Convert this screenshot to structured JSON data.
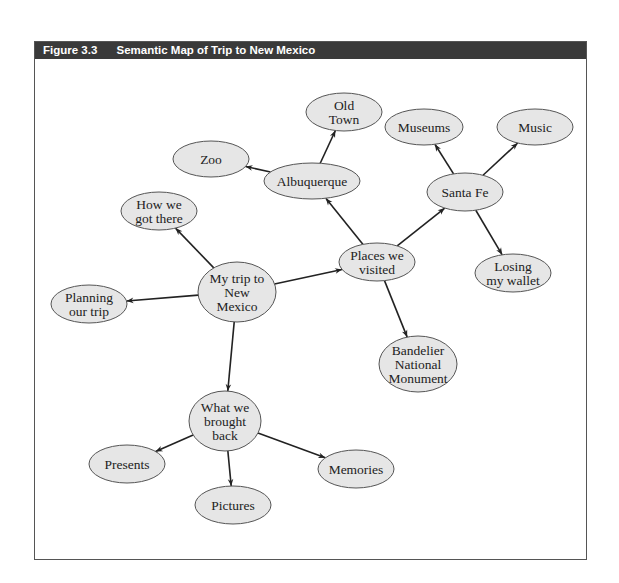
{
  "figure": {
    "number": "Figure 3.3",
    "title": "Semantic Map of Trip to New Mexico",
    "colors": {
      "header_bg": "#3a3a3a",
      "node_fill": "#e6e6e6",
      "node_stroke": "#555555",
      "edge": "#222222"
    }
  },
  "nodes": [
    {
      "id": "center",
      "lines": [
        "My trip to",
        "New",
        "Mexico"
      ],
      "cx": 237,
      "cy": 292,
      "rx": 39,
      "ry": 30
    },
    {
      "id": "howgot",
      "lines": [
        "How we",
        "got there"
      ],
      "cx": 159,
      "cy": 211,
      "rx": 38,
      "ry": 19
    },
    {
      "id": "planning",
      "lines": [
        "Planning",
        "our trip"
      ],
      "cx": 89,
      "cy": 304,
      "rx": 38,
      "ry": 19
    },
    {
      "id": "places",
      "lines": [
        "Places we",
        "visited"
      ],
      "cx": 377,
      "cy": 262,
      "rx": 38,
      "ry": 19
    },
    {
      "id": "albq",
      "lines": [
        "Albuquerque"
      ],
      "cx": 312,
      "cy": 181,
      "rx": 48,
      "ry": 18
    },
    {
      "id": "zoo",
      "lines": [
        "Zoo"
      ],
      "cx": 211,
      "cy": 159,
      "rx": 38,
      "ry": 18
    },
    {
      "id": "oldtown",
      "lines": [
        "Old",
        "Town"
      ],
      "cx": 344,
      "cy": 112,
      "rx": 38,
      "ry": 19
    },
    {
      "id": "santafe",
      "lines": [
        "Santa Fe"
      ],
      "cx": 465,
      "cy": 192,
      "rx": 38,
      "ry": 19
    },
    {
      "id": "museums",
      "lines": [
        "Museums"
      ],
      "cx": 424,
      "cy": 127,
      "rx": 39,
      "ry": 18
    },
    {
      "id": "music",
      "lines": [
        "Music"
      ],
      "cx": 535,
      "cy": 127,
      "rx": 38,
      "ry": 18
    },
    {
      "id": "wallet",
      "lines": [
        "Losing",
        "my wallet"
      ],
      "cx": 513,
      "cy": 273,
      "rx": 38,
      "ry": 19
    },
    {
      "id": "bandelier",
      "lines": [
        "Bandelier",
        "National",
        "Monument"
      ],
      "cx": 418,
      "cy": 364,
      "rx": 39,
      "ry": 28
    },
    {
      "id": "brought",
      "lines": [
        "What we",
        "brought",
        "back"
      ],
      "cx": 225,
      "cy": 421,
      "rx": 36,
      "ry": 30
    },
    {
      "id": "presents",
      "lines": [
        "Presents"
      ],
      "cx": 127,
      "cy": 464,
      "rx": 38,
      "ry": 19
    },
    {
      "id": "pictures",
      "lines": [
        "Pictures"
      ],
      "cx": 233,
      "cy": 505,
      "rx": 38,
      "ry": 19
    },
    {
      "id": "memories",
      "lines": [
        "Memories"
      ],
      "cx": 356,
      "cy": 469,
      "rx": 38,
      "ry": 19
    }
  ],
  "edges": [
    {
      "from": "center",
      "to": "howgot"
    },
    {
      "from": "center",
      "to": "planning"
    },
    {
      "from": "center",
      "to": "places"
    },
    {
      "from": "center",
      "to": "brought"
    },
    {
      "from": "places",
      "to": "albq"
    },
    {
      "from": "places",
      "to": "santafe"
    },
    {
      "from": "places",
      "to": "bandelier"
    },
    {
      "from": "albq",
      "to": "zoo"
    },
    {
      "from": "albq",
      "to": "oldtown"
    },
    {
      "from": "santafe",
      "to": "museums"
    },
    {
      "from": "santafe",
      "to": "music"
    },
    {
      "from": "santafe",
      "to": "wallet"
    },
    {
      "from": "brought",
      "to": "presents"
    },
    {
      "from": "brought",
      "to": "pictures"
    },
    {
      "from": "brought",
      "to": "memories"
    }
  ]
}
